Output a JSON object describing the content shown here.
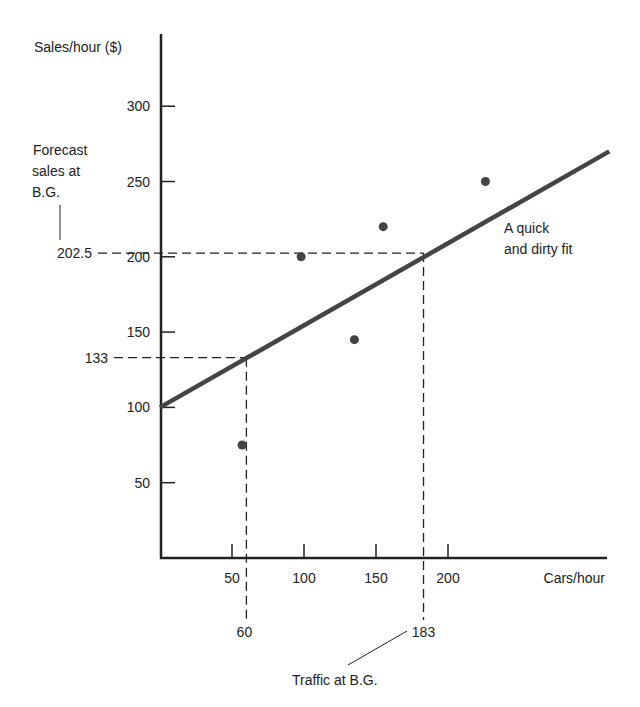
{
  "chart_data": {
    "type": "scatter",
    "title": "",
    "xlabel": "Cars/hour",
    "ylabel": "Sales/hour ($)",
    "xlim": [
      0,
      310
    ],
    "ylim": [
      0,
      300
    ],
    "x_ticks": [
      50,
      100,
      150,
      200
    ],
    "y_ticks": [
      50,
      100,
      150,
      200,
      250,
      300
    ],
    "grid": false,
    "points": [
      {
        "x": 57,
        "y": 75
      },
      {
        "x": 98,
        "y": 200
      },
      {
        "x": 135,
        "y": 145
      },
      {
        "x": 155,
        "y": 220
      },
      {
        "x": 226,
        "y": 250
      }
    ],
    "fit_line": {
      "label": "A quick and dirty fit",
      "x0": 0,
      "y0": 100,
      "x1": 312,
      "y1": 270
    },
    "annotations": [
      {
        "x": 60,
        "y": 133,
        "x_label": "60",
        "y_label": "133"
      },
      {
        "x": 183,
        "y": 202.5,
        "x_label": "183",
        "y_label": "202.5"
      }
    ],
    "callouts": {
      "forecast": [
        "Forecast",
        "sales at",
        "B.G."
      ],
      "traffic": "Traffic at B.G.",
      "fit": [
        "A quick",
        "and dirty fit"
      ]
    }
  }
}
